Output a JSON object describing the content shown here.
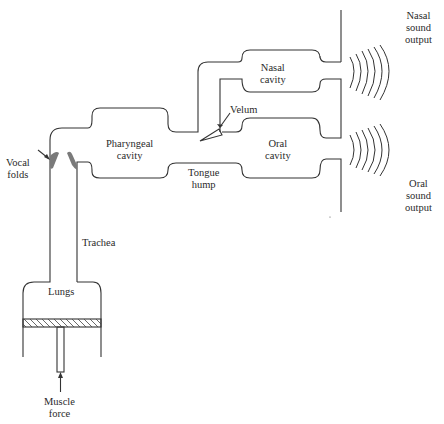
{
  "diagram": {
    "labels": {
      "nasal_sound_output": [
        "Nasal",
        "sound",
        "output"
      ],
      "oral_sound_output": [
        "Oral",
        "sound",
        "output"
      ],
      "nasal_cavity": [
        "Nasal",
        "cavity"
      ],
      "oral_cavity": [
        "Oral",
        "cavity"
      ],
      "pharyngeal_cavity": [
        "Pharyngeal",
        "cavity"
      ],
      "velum": "Velum",
      "tongue_hump": [
        "Tongue",
        "hump"
      ],
      "vocal_folds": [
        "Vocal",
        "folds"
      ],
      "trachea": "Trachea",
      "lungs": "Lungs",
      "muscle_force": [
        "Muscle",
        "force"
      ]
    },
    "colors": {
      "line": "#333333",
      "vocal_folds": "#7a7a7a"
    }
  }
}
